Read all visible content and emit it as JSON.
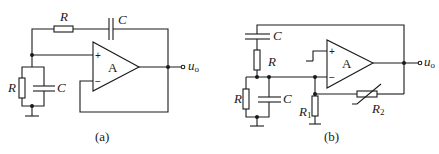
{
  "figure": {
    "circuits": [
      {
        "id": "a",
        "caption": "(a)",
        "opamp_label": "A",
        "plus_sign": "+",
        "minus_sign": "−",
        "components": {
          "series_R": "R",
          "series_C": "C",
          "shunt_R": "R",
          "shunt_C": "C"
        },
        "output_label": "u",
        "output_sub": "o"
      },
      {
        "id": "b",
        "caption": "(b)",
        "opamp_label": "A",
        "plus_sign": "+",
        "minus_sign": "−",
        "components": {
          "series_C": "C",
          "series_R": "R",
          "shunt_R": "R",
          "shunt_C": "C",
          "R1": "R",
          "R1_sub": "1",
          "R2": "R",
          "R2_sub": "2"
        },
        "output_label": "u",
        "output_sub": "o"
      }
    ]
  }
}
